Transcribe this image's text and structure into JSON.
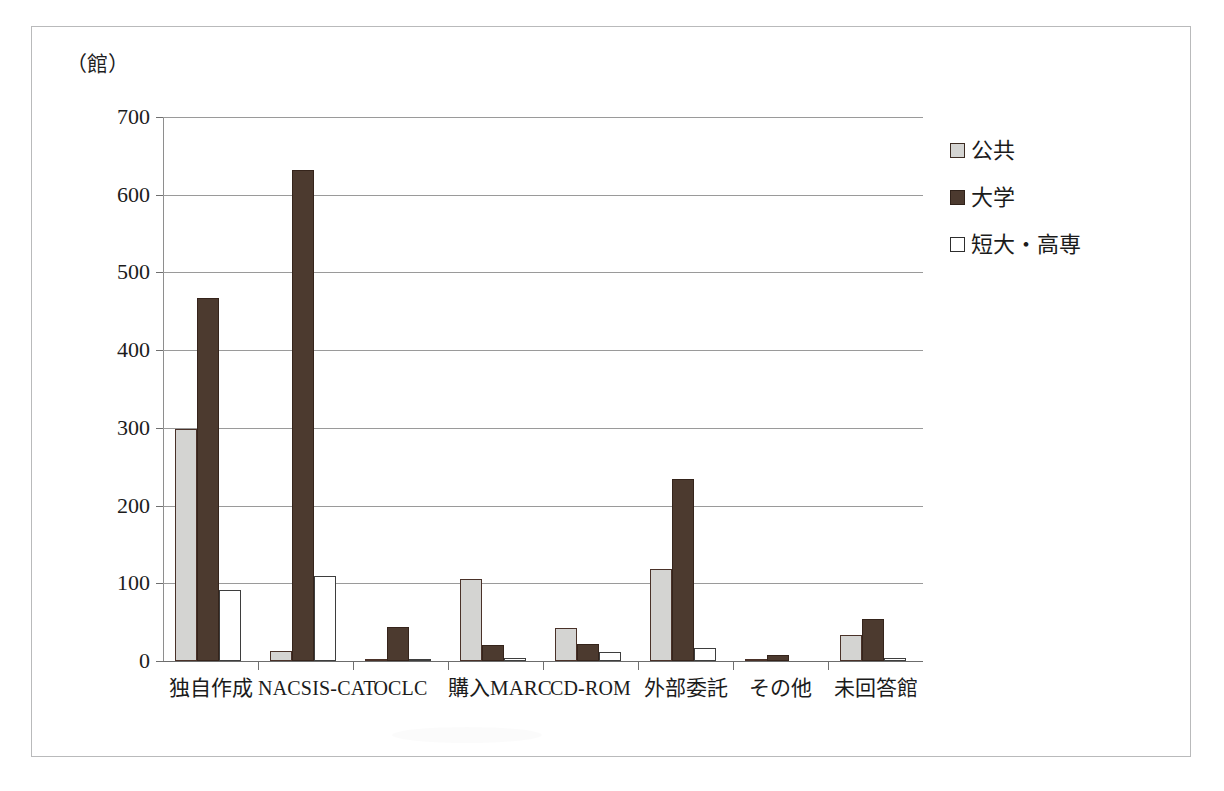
{
  "figure": {
    "unit_label": "（館）"
  },
  "legend": {
    "position": "right",
    "entries": [
      {
        "label": "公共",
        "color": "#d4d4d2"
      },
      {
        "label": "大学",
        "color": "#4c3a2f"
      },
      {
        "label": "短大・高専",
        "color": "#ffffff"
      }
    ]
  },
  "y_axis": {
    "ticks": [
      "0",
      "100",
      "200",
      "300",
      "400",
      "500",
      "600",
      "700"
    ]
  },
  "x_axis": {
    "labels": [
      "独自作成",
      "NACSIS-CAT",
      "OCLC",
      "購入MARC",
      "CD-ROM",
      "外部委託",
      "その他",
      "未回答館"
    ]
  },
  "chart_data": {
    "type": "bar",
    "title": "",
    "xlabel": "",
    "ylabel": "（館）",
    "ylim": [
      0,
      700
    ],
    "ytick_step": 100,
    "grid": true,
    "legend_position": "right",
    "categories": [
      "独自作成",
      "NACSIS-CAT",
      "OCLC",
      "購入MARC",
      "CD-ROM",
      "外部委託",
      "その他",
      "未回答館"
    ],
    "series": [
      {
        "name": "公共",
        "color": "#d4d4d2",
        "values": [
          298,
          13,
          3,
          105,
          42,
          119,
          3,
          34
        ]
      },
      {
        "name": "大学",
        "color": "#4c3a2f",
        "values": [
          467,
          632,
          44,
          20,
          22,
          234,
          8,
          54
        ]
      },
      {
        "name": "短大・高専",
        "color": "#ffffff",
        "values": [
          92,
          110,
          2,
          4,
          12,
          17,
          0,
          4
        ]
      }
    ]
  }
}
